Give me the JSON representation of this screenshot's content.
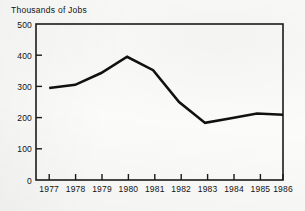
{
  "chart_data": {
    "type": "line",
    "title": "Thousands of Jobs",
    "xlabel": "",
    "ylabel": "",
    "categories": [
      "1977",
      "1978",
      "1979",
      "1980",
      "1981",
      "1982",
      "1983",
      "1984",
      "1985",
      "1986"
    ],
    "x": [
      1977,
      1978,
      1979,
      1980,
      1981,
      1982,
      1983,
      1984,
      1985,
      1986
    ],
    "values": [
      295,
      305,
      343,
      395,
      352,
      250,
      183,
      198,
      213,
      209
    ],
    "series": [
      {
        "name": "Thousands of Jobs",
        "values": [
          295,
          305,
          343,
          395,
          352,
          250,
          183,
          198,
          213,
          209
        ]
      }
    ],
    "ylim": [
      0,
      500
    ],
    "yticks": [
      0,
      100,
      200,
      300,
      400,
      500
    ],
    "ytick_labels": [
      "0",
      "100",
      "200",
      "300",
      "400",
      "500"
    ],
    "xtick_labels": [
      "1977",
      "1978",
      "1979",
      "1980",
      "1981",
      "1982",
      "1983",
      "1984",
      "1985",
      "1986"
    ],
    "grid": false,
    "legend": false,
    "legend_position": "none",
    "line_color": "#101010",
    "axis_color": "#1b1b1b",
    "background_color": "#fbfbfa"
  }
}
